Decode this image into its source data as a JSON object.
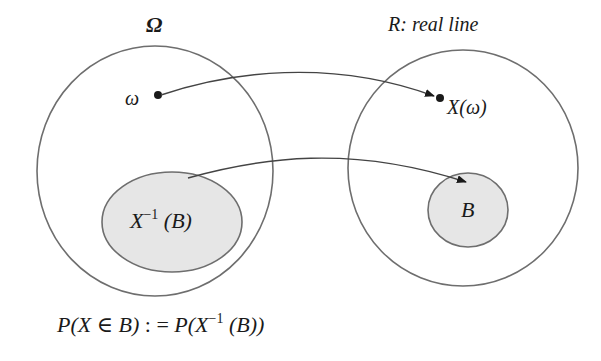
{
  "diagram": {
    "left_set": {
      "label": "Ω",
      "point_label": "ω",
      "subset_label_base": "X",
      "subset_label_sup": "−1",
      "subset_label_arg": " (B)"
    },
    "right_set": {
      "label": "R: real line",
      "point_label": "X(ω)",
      "subset_label": "B"
    },
    "arrows": [
      {
        "from": "ω",
        "to": "X(ω)"
      },
      {
        "from": "X⁻¹(B)",
        "to": "B"
      }
    ],
    "formula": {
      "lhs": "P(X ∈ B)",
      "assign": " : = ",
      "rhs_prefix": "P(X",
      "rhs_sup": "−1",
      "rhs_suffix": " (B))"
    },
    "colors": {
      "stroke": "#6e6e6e",
      "fill_shaded": "#e6e6e6",
      "arrow": "#2a2a2a",
      "background": "#ffffff"
    }
  }
}
